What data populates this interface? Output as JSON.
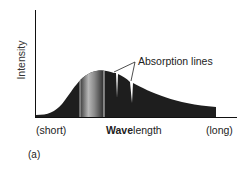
{
  "figure": {
    "y_axis_label": "Intensity",
    "x_axis_label_bold": "Wave",
    "x_axis_label_rest": "length",
    "x_left_label": "(short)",
    "x_right_label": "(long)",
    "annotation": "Absorption lines",
    "panel_label": "(a)",
    "colors": {
      "fill": "#1e1e1e",
      "visible_band_light": "#d0d0d0",
      "axis": "#111111"
    }
  }
}
